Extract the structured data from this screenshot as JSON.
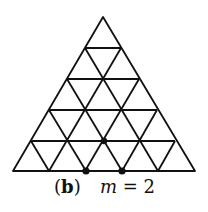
{
  "figure": {
    "label_open": "(",
    "label_letter": "b",
    "label_close": ")",
    "m_var": "m",
    "m_eq": " = ",
    "m_value": "2",
    "grid_rows": 5,
    "line_color": "#111111",
    "highlighted_points": [
      {
        "row": 5,
        "col": 2,
        "position": "base"
      },
      {
        "row": 5,
        "col": 3,
        "position": "base"
      },
      {
        "row": 4,
        "col": 2,
        "position": "interior"
      }
    ]
  }
}
